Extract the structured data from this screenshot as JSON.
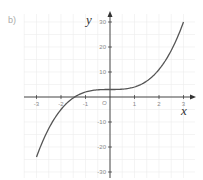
{
  "part_label": "b)",
  "chart_data": {
    "type": "line",
    "title": "",
    "function": "y = x^3 + 3",
    "xlabel": "x",
    "ylabel": "y",
    "origin_label": "O",
    "xlim": [
      -3,
      3
    ],
    "ylim": [
      -30,
      30
    ],
    "x_ticks": [
      -3,
      -2,
      -1,
      1,
      2,
      3
    ],
    "x_tick_labels": [
      "-3",
      "-2",
      "-1",
      "1",
      "2",
      "3"
    ],
    "y_ticks": [
      30,
      20,
      10,
      -10,
      -20,
      -30
    ],
    "y_tick_labels": [
      "30",
      "20",
      "10",
      "-10",
      "-20",
      "-30"
    ],
    "grid": true,
    "series": [
      {
        "name": "curve",
        "x": [
          -3,
          -2.5,
          -2,
          -1.5,
          -1,
          -0.5,
          0,
          0.5,
          1,
          1.5,
          2,
          2.5,
          3
        ],
        "y": [
          -24,
          -12.6,
          -5,
          -0.4,
          2,
          2.9,
          3,
          3.1,
          4,
          6.4,
          11,
          18.6,
          30
        ]
      }
    ],
    "colors": {
      "curve": "#555555",
      "axis": "#333333",
      "grid": "#ececec",
      "tick_text": "#8a8a8a"
    }
  }
}
